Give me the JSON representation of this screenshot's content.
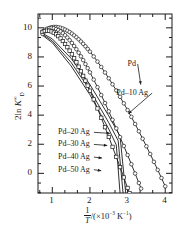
{
  "figure": {
    "background": "#ffffff",
    "ink": "#1a1a1a",
    "width": 195,
    "height": 232
  },
  "axes": {
    "x": {
      "label_prefix": "1",
      "label_denominator": "T",
      "label_suffix_open": "/(×10",
      "label_exponent": "−3",
      "label_units": " K",
      "label_units_exponent": "−1",
      "label_suffix_close": ")",
      "ticks": [
        1,
        2,
        3,
        4
      ],
      "tick_labels": [
        "1",
        "2",
        "3",
        "4"
      ],
      "min": 0.62,
      "max": 4.18,
      "minor_per_major": 2
    },
    "y": {
      "label_prefix": "2ln ",
      "label_symbol": "K",
      "label_sub": "D",
      "label_sup": "∞",
      "ticks": [
        0,
        2,
        4,
        6,
        8,
        10
      ],
      "tick_labels": [
        "0",
        "2",
        "4",
        "6",
        "8",
        "10"
      ],
      "min": -1.35,
      "max": 10.95,
      "minor_per_major": 2
    },
    "frame": {
      "left": 38,
      "top": 14,
      "right": 172,
      "bottom": 193
    }
  },
  "chart_data": {
    "type": "line",
    "title": "",
    "xlabel": "1/T /(×10⁻³ K⁻¹)",
    "ylabel": "2ln K_D^∞",
    "xlim": [
      0.62,
      4.18
    ],
    "ylim": [
      -1.35,
      10.95
    ],
    "grid": false,
    "legend": "inline-annotations",
    "marker_style": "open",
    "series": [
      {
        "name": "Pd",
        "label": "Pd",
        "marker": "circle-open",
        "points": [
          [
            0.74,
            9.58
          ],
          [
            0.8,
            9.76
          ],
          [
            0.86,
            9.9
          ],
          [
            0.92,
            9.99
          ],
          [
            0.98,
            10.04
          ],
          [
            1.04,
            10.06
          ],
          [
            1.1,
            10.06
          ],
          [
            1.16,
            10.04
          ],
          [
            1.22,
            10.0
          ],
          [
            1.28,
            9.95
          ],
          [
            1.34,
            9.88
          ],
          [
            1.4,
            9.8
          ],
          [
            1.46,
            9.71
          ],
          [
            1.52,
            9.6
          ],
          [
            1.58,
            9.48
          ],
          [
            1.64,
            9.35
          ],
          [
            1.7,
            9.21
          ],
          [
            1.76,
            9.06
          ],
          [
            1.82,
            8.9
          ],
          [
            1.88,
            8.73
          ],
          [
            1.94,
            8.55
          ],
          [
            2.0,
            8.36
          ],
          [
            2.1,
            8.03
          ],
          [
            2.2,
            7.68
          ],
          [
            2.3,
            7.31
          ],
          [
            2.4,
            6.93
          ],
          [
            2.5,
            6.53
          ],
          [
            2.6,
            6.12
          ],
          [
            2.7,
            5.7
          ],
          [
            2.8,
            5.26
          ],
          [
            2.9,
            4.81
          ],
          [
            3.0,
            4.35
          ],
          [
            3.1,
            3.88
          ],
          [
            3.2,
            3.39
          ],
          [
            3.3,
            2.89
          ],
          [
            3.4,
            2.38
          ],
          [
            3.5,
            1.86
          ],
          [
            3.6,
            1.33
          ],
          [
            3.7,
            0.79
          ],
          [
            3.8,
            0.24
          ],
          [
            3.9,
            -0.32
          ],
          [
            4.0,
            -0.89
          ]
        ]
      },
      {
        "name": "Pd-10Ag",
        "label": "Pd–10 Ag",
        "marker": "circle-open",
        "points": [
          [
            0.74,
            9.75
          ],
          [
            0.8,
            9.86
          ],
          [
            0.86,
            9.94
          ],
          [
            0.92,
            9.98
          ],
          [
            0.98,
            9.99
          ],
          [
            1.04,
            9.97
          ],
          [
            1.1,
            9.92
          ],
          [
            1.16,
            9.85
          ],
          [
            1.22,
            9.75
          ],
          [
            1.28,
            9.63
          ],
          [
            1.34,
            9.49
          ],
          [
            1.4,
            9.33
          ],
          [
            1.46,
            9.15
          ],
          [
            1.52,
            8.96
          ],
          [
            1.58,
            8.75
          ],
          [
            1.64,
            8.53
          ],
          [
            1.7,
            8.29
          ],
          [
            1.76,
            8.04
          ],
          [
            1.82,
            7.78
          ],
          [
            1.88,
            7.51
          ],
          [
            1.94,
            7.23
          ],
          [
            2.0,
            6.94
          ],
          [
            2.1,
            6.44
          ],
          [
            2.2,
            5.92
          ],
          [
            2.3,
            5.38
          ],
          [
            2.4,
            4.83
          ],
          [
            2.5,
            4.26
          ],
          [
            2.6,
            3.68
          ],
          [
            2.7,
            3.09
          ],
          [
            2.8,
            2.49
          ],
          [
            2.9,
            1.88
          ],
          [
            3.0,
            1.26
          ],
          [
            3.1,
            0.63
          ],
          [
            3.2,
            -0.01
          ],
          [
            3.3,
            -0.66
          ],
          [
            3.36,
            -1.05
          ]
        ]
      },
      {
        "name": "Pd-20Ag",
        "label": "Pd–20 Ag",
        "marker": "square-open",
        "points": [
          [
            0.74,
            9.72
          ],
          [
            0.8,
            9.78
          ],
          [
            0.86,
            9.81
          ],
          [
            0.92,
            9.8
          ],
          [
            0.98,
            9.75
          ],
          [
            1.04,
            9.67
          ],
          [
            1.1,
            9.56
          ],
          [
            1.16,
            9.43
          ],
          [
            1.22,
            9.27
          ],
          [
            1.28,
            9.09
          ],
          [
            1.34,
            8.89
          ],
          [
            1.4,
            8.67
          ],
          [
            1.46,
            8.43
          ],
          [
            1.52,
            8.18
          ],
          [
            1.58,
            7.91
          ],
          [
            1.64,
            7.63
          ],
          [
            1.7,
            7.33
          ],
          [
            1.76,
            7.02
          ],
          [
            1.82,
            6.7
          ],
          [
            1.88,
            6.37
          ],
          [
            1.94,
            6.03
          ],
          [
            2.0,
            5.68
          ],
          [
            2.1,
            5.08
          ],
          [
            2.2,
            4.46
          ],
          [
            2.3,
            3.82
          ],
          [
            2.4,
            3.17
          ],
          [
            2.5,
            2.5
          ],
          [
            2.6,
            1.82
          ],
          [
            2.7,
            1.13
          ],
          [
            2.8,
            0.43
          ],
          [
            2.9,
            -0.28
          ],
          [
            3.0,
            -1.0
          ],
          [
            3.05,
            -1.35
          ]
        ]
      },
      {
        "name": "Pd-30Ag",
        "label": "Pd–30 Ag",
        "marker": "line-only",
        "points": [
          [
            0.74,
            9.62
          ],
          [
            1.0,
            9.24
          ],
          [
            1.5,
            7.9
          ],
          [
            2.0,
            6.1
          ],
          [
            2.5,
            3.95
          ],
          [
            2.8,
            2.55
          ],
          [
            2.95,
            -1.35
          ]
        ]
      },
      {
        "name": "Pd-40Ag",
        "label": "Pd–40 Ag",
        "marker": "line-only",
        "points": [
          [
            0.74,
            9.55
          ],
          [
            1.0,
            9.1
          ],
          [
            1.5,
            7.62
          ],
          [
            2.0,
            5.72
          ],
          [
            2.5,
            3.48
          ],
          [
            2.75,
            2.25
          ],
          [
            2.88,
            -1.35
          ]
        ]
      },
      {
        "name": "Pd-50Ag",
        "label": "Pd–50 Ag",
        "marker": "line-only",
        "points": [
          [
            0.74,
            9.48
          ],
          [
            1.0,
            8.98
          ],
          [
            1.5,
            7.38
          ],
          [
            2.0,
            5.4
          ],
          [
            2.5,
            3.05
          ],
          [
            2.7,
            1.95
          ],
          [
            2.8,
            -1.35
          ]
        ]
      }
    ],
    "annotations": [
      {
        "text": "Pd",
        "side": "right",
        "x": 3.0,
        "y": 7.45,
        "target_x": 3.35,
        "target_y": 6.1
      },
      {
        "text": "Pd–10 Ag",
        "side": "right",
        "x": 2.7,
        "y": 5.45,
        "target_x": 3.02,
        "target_y": 4.1
      },
      {
        "text": "Pd–20 Ag",
        "side": "left",
        "x": 1.15,
        "y": 2.75,
        "target_x": 2.53,
        "target_y": 2.75
      },
      {
        "text": "Pd–30 Ag",
        "side": "left",
        "x": 1.15,
        "y": 1.92,
        "target_x": 2.46,
        "target_y": 1.92
      },
      {
        "text": "Pd–40 Ag",
        "side": "left",
        "x": 1.15,
        "y": 1.05,
        "target_x": 2.32,
        "target_y": 1.05
      },
      {
        "text": "Pd–50 Ag",
        "side": "left",
        "x": 1.15,
        "y": 0.18,
        "target_x": 2.3,
        "target_y": 0.18
      }
    ]
  }
}
